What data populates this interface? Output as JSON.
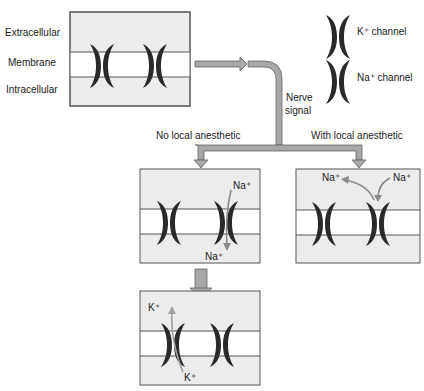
{
  "side_labels": {
    "extracellular": "Extracellular",
    "membrane": "Membrane",
    "intracellular": "Intracellular"
  },
  "legend": {
    "k_channel": "K⁺ channel",
    "na_channel": "Na⁺ channel"
  },
  "flow": {
    "nerve_signal_line1": "Nerve",
    "nerve_signal_line2": "signal",
    "no_anesthetic": "No local anesthetic",
    "with_anesthetic": "With local anesthetic"
  },
  "ions": {
    "na_top_no": "Na⁺",
    "na_bottom_no": "Na⁺",
    "na_left_with": "Na⁺",
    "na_right_with": "Na⁺",
    "k_top": "K⁺",
    "k_bottom": "K⁺"
  },
  "colors": {
    "extracellular_fill": "#ececec",
    "membrane_fill": "#ffffff",
    "box_stroke": "#555555",
    "channel": "#2a2a2a",
    "arrow_fill": "#a8a8a8",
    "arrow_stroke": "#666666",
    "ion_arrow": "#8a8a8a"
  }
}
